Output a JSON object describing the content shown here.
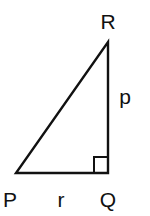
{
  "diagram": {
    "type": "right-triangle",
    "colors": {
      "stroke": "#111111",
      "background": "#ffffff"
    },
    "vertices": {
      "P": {
        "label": "P"
      },
      "Q": {
        "label": "Q"
      },
      "R": {
        "label": "R"
      }
    },
    "sides": {
      "PQ": {
        "label": "r"
      },
      "QR": {
        "label": "p"
      }
    },
    "right_angle_at": "Q"
  }
}
